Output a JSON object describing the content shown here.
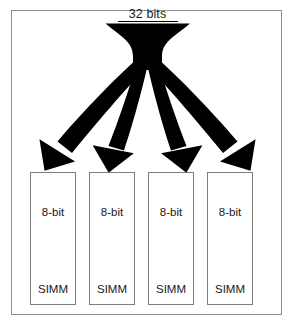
{
  "figure": {
    "background_color": "#ffffff",
    "frame_color": "#8e8e8e",
    "ink_color": "#000000"
  },
  "bus": {
    "label": "32 bits",
    "width_bits": 32,
    "underline": true
  },
  "modules": [
    {
      "width_label": "8-bit",
      "name_label": "SIMM",
      "bits": 8
    },
    {
      "width_label": "8-bit",
      "name_label": "SIMM",
      "bits": 8
    },
    {
      "width_label": "8-bit",
      "name_label": "SIMM",
      "bits": 8
    },
    {
      "width_label": "8-bit",
      "name_label": "SIMM",
      "bits": 8
    }
  ],
  "arrows": {
    "count": 4,
    "direction": "down",
    "color": "#000000",
    "names": [
      "arrow-to-simm-1",
      "arrow-to-simm-2",
      "arrow-to-simm-3",
      "arrow-to-simm-4"
    ]
  }
}
